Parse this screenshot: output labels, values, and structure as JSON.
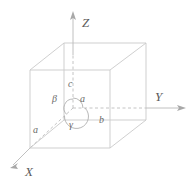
{
  "figure": {
    "background_color": "#ffffff",
    "line_color": "#c9c9c9",
    "text_color": "#6a6a6a"
  },
  "axes": [
    {
      "key": "z",
      "label": "Z",
      "direction": "up"
    },
    {
      "key": "y",
      "label": "Y",
      "direction": "right"
    },
    {
      "key": "x",
      "label": "X",
      "direction": "down-left"
    }
  ],
  "lattice_parameters": [
    {
      "key": "a_vertical",
      "label": "a",
      "note": "edge along a near origin"
    },
    {
      "key": "b",
      "label": "b",
      "note": "edge along Y"
    },
    {
      "key": "c",
      "label": "c",
      "note": "edge along Z"
    },
    {
      "key": "a_x",
      "label": "a",
      "note": "edge along X"
    }
  ],
  "angles": [
    {
      "key": "alpha",
      "label": "α"
    },
    {
      "key": "beta",
      "label": "β"
    },
    {
      "key": "gamma",
      "label": "γ"
    }
  ],
  "labels": {
    "axis_z": "Z",
    "axis_y": "Y",
    "axis_x": "X",
    "param_a_center": "a",
    "param_b": "b",
    "param_c": "c",
    "param_a_x": "a",
    "angle_alpha": "α",
    "angle_beta": "β",
    "angle_gamma": "γ"
  }
}
